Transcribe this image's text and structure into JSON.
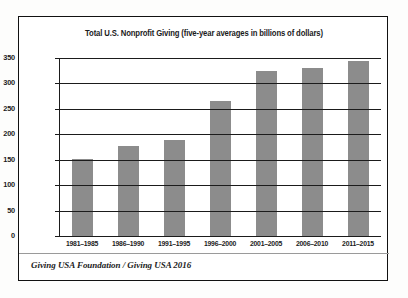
{
  "chart_data": {
    "type": "bar",
    "title": "Total U.S. Nonprofit Giving (five-year averages in billions of dollars)",
    "xlabel": "",
    "ylabel": "",
    "categories": [
      "1981–1985",
      "1986–1990",
      "1991–1995",
      "1996–2000",
      "2001–2005",
      "2006–2010",
      "2011–2015"
    ],
    "values": [
      151,
      177,
      188,
      266,
      325,
      331,
      345
    ],
    "ylim": [
      0,
      350
    ],
    "yticks": [
      "0",
      "50",
      "100",
      "150",
      "200",
      "250",
      "300",
      "350"
    ],
    "ytick_values": [
      0,
      50,
      100,
      150,
      200,
      250,
      300,
      350
    ],
    "grid": true,
    "legend": false,
    "bar_color": "#8c8c8c",
    "axis_color": "#1b1b1b"
  },
  "source": {
    "note": "Giving USA Foundation / Giving USA 2016"
  }
}
